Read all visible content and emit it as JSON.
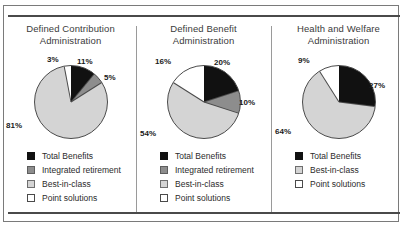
{
  "chart_data": [
    {
      "type": "pie",
      "title": "Defined Contribution Administration",
      "title_lines": [
        "Defined Contribution",
        "Administration"
      ],
      "categories": [
        "Total Benefits",
        "Integrated retirement",
        "Best-in-class",
        "Point solutions"
      ],
      "values": [
        11,
        5,
        81,
        3
      ],
      "labels": [
        "11%",
        "5%",
        "81%",
        "3%"
      ],
      "colors": [
        "#111111",
        "#8d8d8d",
        "#d4d4d4",
        "#ffffff"
      ],
      "legend_position": "bottom-left",
      "start_angle_deg": 0,
      "direction": "clockwise"
    },
    {
      "type": "pie",
      "title": "Defined Benefit Administration",
      "title_lines": [
        "Defined Benefit",
        "Administration"
      ],
      "categories": [
        "Total Benefits",
        "Integrated retirement",
        "Best-in-class",
        "Point solutions"
      ],
      "values": [
        20,
        10,
        54,
        16
      ],
      "labels": [
        "20%",
        "10%",
        "54%",
        "16%"
      ],
      "colors": [
        "#111111",
        "#8d8d8d",
        "#d4d4d4",
        "#ffffff"
      ],
      "legend_position": "bottom-left",
      "start_angle_deg": 0,
      "direction": "clockwise"
    },
    {
      "type": "pie",
      "title": "Health and Welfare Administration",
      "title_lines": [
        "Health and Welfare",
        "Administration"
      ],
      "categories": [
        "Total Benefits",
        "Best-in-class",
        "Point solutions"
      ],
      "values": [
        27,
        64,
        9
      ],
      "labels": [
        "27%",
        "64%",
        "9%"
      ],
      "colors": [
        "#111111",
        "#d4d4d4",
        "#ffffff"
      ],
      "legend_position": "bottom-left",
      "start_angle_deg": 0,
      "direction": "clockwise"
    }
  ],
  "panels": [
    {
      "title_line1": "Defined Contribution",
      "title_line2": "Administration",
      "pct_a": "11%",
      "pct_b": "5%",
      "pct_c": "81%",
      "pct_d": "3%",
      "legend": [
        {
          "label": "Total Benefits",
          "swatch": "sw-black"
        },
        {
          "label": "Integrated retirement",
          "swatch": "sw-dgray"
        },
        {
          "label": "Best-in-class",
          "swatch": "sw-lgray"
        },
        {
          "label": "Point solutions",
          "swatch": "sw-white"
        }
      ]
    },
    {
      "title_line1": "Defined Benefit",
      "title_line2": "Administration",
      "pct_a": "20%",
      "pct_b": "10%",
      "pct_c": "54%",
      "pct_d": "16%",
      "legend": [
        {
          "label": "Total Benefits",
          "swatch": "sw-black"
        },
        {
          "label": "Integrated retirement",
          "swatch": "sw-dgray"
        },
        {
          "label": "Best-in-class",
          "swatch": "sw-lgray"
        },
        {
          "label": "Point solutions",
          "swatch": "sw-white"
        }
      ]
    },
    {
      "title_line1": "Health and Welfare",
      "title_line2": "Administration",
      "pct_a": "27%",
      "pct_c": "64%",
      "pct_d": "9%",
      "legend": [
        {
          "label": "Total Benefits",
          "swatch": "sw-black"
        },
        {
          "label": "Best-in-class",
          "swatch": "sw-lgray"
        },
        {
          "label": "Point solutions",
          "swatch": "sw-white"
        }
      ]
    }
  ],
  "colors": {
    "slice_black": "#111111",
    "slice_dark_gray": "#8d8d8d",
    "slice_light_gray": "#d4d4d4",
    "slice_white": "#ffffff",
    "outline": "#4a4a4a",
    "rule": "#4a4a4a",
    "border": "#7a7a7a",
    "title_text": "#3b3b3b"
  }
}
